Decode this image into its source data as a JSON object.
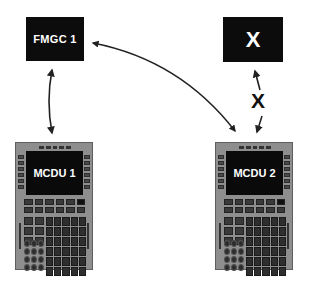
{
  "diagram": {
    "nodes": {
      "fmgc1": {
        "label": "FMGC 1"
      },
      "x_box": {
        "label": "X"
      },
      "mcdu1": {
        "label": "MCDU 1"
      },
      "mcdu2": {
        "label": "MCDU 2"
      }
    },
    "edges": [
      {
        "from": "FMGC 1",
        "to": "MCDU 1",
        "type": "bidirectional"
      },
      {
        "from": "FMGC 1",
        "to": "MCDU 2",
        "type": "bidirectional"
      },
      {
        "from": "X",
        "to": "MCDU 2",
        "type": "bidirectional",
        "status": "blocked"
      }
    ],
    "blocked_link_label": "X"
  },
  "colors": {
    "box_fill": "#0c0c0c",
    "box_text": "#ffffff",
    "arrow": "#222222",
    "mcdu_body": "#8e8e8e"
  }
}
